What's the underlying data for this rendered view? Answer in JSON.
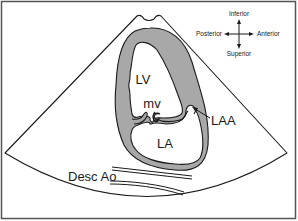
{
  "diagram": {
    "type": "echocardiography-sector-schematic",
    "labels": {
      "lv": "LV",
      "mv": "mv",
      "la": "LA",
      "laa": "LAA",
      "desc_ao": "Desc Ao"
    },
    "orientation": {
      "top": "Inferior",
      "bottom": "Superior",
      "left": "Posterior",
      "right": "Anterior"
    },
    "colors": {
      "background": "#ffffff",
      "line": "#1a1a1a",
      "myocardium": "#a8a8a8",
      "frame": "#555555"
    }
  }
}
